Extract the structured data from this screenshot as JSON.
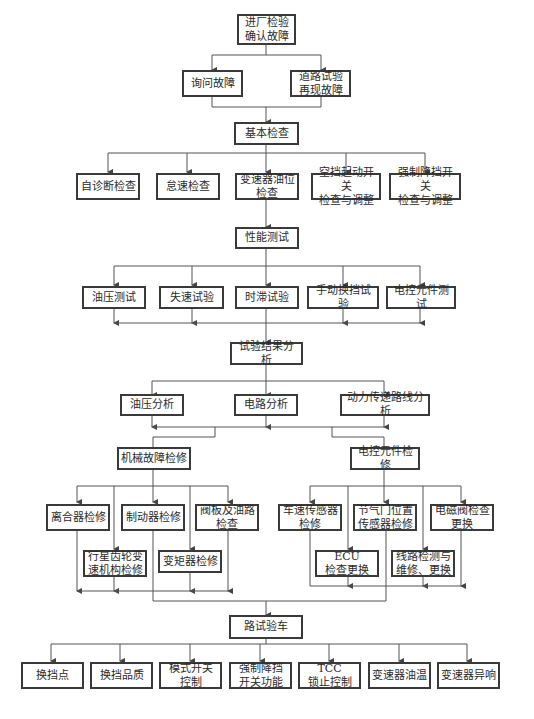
{
  "diagram": {
    "title_node": "进厂检验\n确认故障",
    "level1": [
      "询问故障",
      "道路试验\n再现故障"
    ],
    "basic_check": {
      "label": "基本检查",
      "children": [
        "自诊断检查",
        "怠速检查",
        "变速器油位\n检查",
        "空挡起动开关\n检查与调整",
        "强制降挡开关\n检查与调整"
      ]
    },
    "performance_test": {
      "label": "性能测试",
      "children": [
        "油压测试",
        "失速试验",
        "时滞试验",
        "手动换挡试验",
        "电控元件测试"
      ]
    },
    "result_analysis": {
      "label": "试验结果分析",
      "children": [
        "油压分析",
        "电路分析",
        "动力传递路线分析"
      ]
    },
    "mechanical_repair": {
      "label": "机械故障检修",
      "children": [
        "离合器检修",
        "制动器检修",
        "阀板及油路\n检查",
        "行星齿轮变\n速机构检修",
        "变矩器检修"
      ]
    },
    "electronic_repair": {
      "label": "电控元件检修",
      "children": [
        "车速传感器\n检修",
        "节气门位置\n传感器检修",
        "电磁阀检查\n更换",
        "ECU\n检查更换",
        "线路检测与\n维修、更换"
      ]
    },
    "road_test": {
      "label": "路试验车",
      "children": [
        "换挡点",
        "换挡品质",
        "模式开关\n控制",
        "强制降挡\n开关功能",
        "TCC\n锁止控制",
        "变速器油温",
        "变速器异响"
      ]
    }
  },
  "colors": {
    "border": "#3a3a3a",
    "line": "#555555",
    "background": "#ffffff"
  }
}
